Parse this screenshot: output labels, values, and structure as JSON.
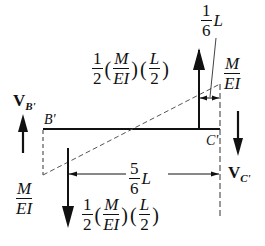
{
  "diagram": {
    "beam": {
      "left_label": "B'",
      "right_label": "C'"
    },
    "reactions": {
      "left": {
        "label": "V",
        "subscript": "B'",
        "direction": "up"
      },
      "right": {
        "label": "V",
        "subscript": "C'",
        "direction": "down"
      }
    },
    "loading": {
      "top_right_ordinate": {
        "num": "M",
        "den": "EI"
      },
      "bottom_left_ordinate": {
        "num": "M",
        "den": "EI"
      }
    },
    "resultants": {
      "upper": {
        "coef_num": "1",
        "coef_den": "2",
        "term1_num": "M",
        "term1_den": "EI",
        "term2_num": "L",
        "term2_den": "2",
        "direction": "up"
      },
      "lower": {
        "coef_num": "1",
        "coef_den": "2",
        "term1_num": "M",
        "term1_den": "EI",
        "term2_num": "L",
        "term2_den": "2",
        "direction": "down"
      }
    },
    "dimensions": {
      "top": {
        "num": "1",
        "den": "6",
        "var": "L"
      },
      "bottom": {
        "num": "5",
        "den": "6",
        "var": "L"
      }
    },
    "parens": {
      "open": "(",
      "close": ")"
    }
  }
}
